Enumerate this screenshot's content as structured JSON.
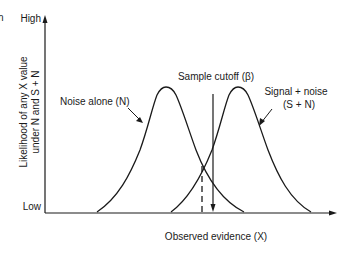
{
  "figure": {
    "clipped_text": "n",
    "y_axis": {
      "label_line1": "Likelihood of any X value",
      "label_line2": "under N and S + N",
      "top_tick": "High",
      "bottom_tick": "Low"
    },
    "x_axis": {
      "label": "Observed evidence (X)"
    },
    "curves": {
      "noise": {
        "label": "Noise alone (N)"
      },
      "signal": {
        "label_line1": "Signal + noise",
        "label_line2": "(S + N)"
      }
    },
    "cutoff": {
      "label": "Sample cutoff (β)"
    },
    "colors": {
      "line": "#1a1a1a",
      "background": "#ffffff"
    }
  }
}
